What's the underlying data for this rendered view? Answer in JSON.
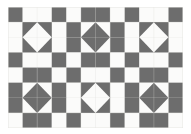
{
  "figure": {
    "page_background": "#ffffff",
    "panel_background": "#fbfbfa"
  },
  "palette": {
    "dark": "#6d6d6d",
    "light": "#fbfbfa",
    "grid_line": "#dcdcd8",
    "panel_edge": "#e6e6e2"
  },
  "geometry": {
    "panel_x": 8,
    "panel_y": 7,
    "panel_width": 175,
    "panel_height": 121,
    "columns": 12,
    "rows": 8,
    "cell_width": 14.583,
    "cell_height": 15.125,
    "block_columns": 3,
    "block_rows": 2,
    "block_cells_wide": 4,
    "block_cells_tall": 4
  },
  "chart_data": {
    "type": "heatmap",
    "xlabel": "",
    "ylabel": "",
    "columns": 12,
    "rows": 8,
    "legend": [
      {
        "name": "dark patch",
        "color": "#6d6d6d",
        "value": 1
      },
      {
        "name": "light patch",
        "color": "#fbfbfa",
        "value": 0
      }
    ],
    "grid": [
      [
        1,
        0,
        0,
        1,
        0,
        1,
        1,
        0,
        1,
        0,
        0,
        1
      ],
      [
        0,
        1,
        1,
        0,
        1,
        1,
        1,
        1,
        0,
        1,
        1,
        0
      ],
      [
        0,
        1,
        1,
        0,
        1,
        1,
        1,
        1,
        0,
        1,
        1,
        0
      ],
      [
        1,
        0,
        0,
        1,
        0,
        1,
        1,
        0,
        1,
        0,
        0,
        1
      ],
      [
        0,
        1,
        1,
        0,
        1,
        0,
        0,
        1,
        0,
        1,
        1,
        0
      ],
      [
        1,
        1,
        1,
        1,
        0,
        1,
        1,
        0,
        1,
        1,
        1,
        1
      ],
      [
        1,
        1,
        1,
        1,
        0,
        1,
        1,
        0,
        1,
        1,
        1,
        1
      ],
      [
        0,
        1,
        1,
        0,
        1,
        0,
        0,
        1,
        0,
        1,
        1,
        0
      ]
    ],
    "blocks": [
      {
        "id": "block-r1c1",
        "row": 0,
        "col": 0,
        "diamond": "light",
        "corners": "dark"
      },
      {
        "id": "block-r1c2",
        "row": 0,
        "col": 1,
        "diamond": "dark",
        "corners": "light"
      },
      {
        "id": "block-r1c3",
        "row": 0,
        "col": 2,
        "diamond": "light",
        "corners": "dark"
      },
      {
        "id": "block-r2c1",
        "row": 1,
        "col": 0,
        "diamond": "dark",
        "corners": "light"
      },
      {
        "id": "block-r2c2",
        "row": 1,
        "col": 1,
        "diamond": "light",
        "corners": "dark"
      },
      {
        "id": "block-r2c3",
        "row": 1,
        "col": 2,
        "diamond": "dark",
        "corners": "light"
      }
    ]
  }
}
